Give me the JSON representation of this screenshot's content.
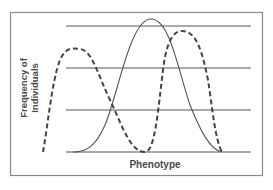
{
  "figure": {
    "x_axis_label": "Phenotype",
    "y_axis_label_line1": "Frequency of",
    "y_axis_label_line2": "Individuals"
  },
  "legend_semantics": {
    "solid_curve": "original distribution (bell-shaped)",
    "dashed_curve": "bimodal distribution (disruptive selection)"
  },
  "colors": {
    "line": "#555555",
    "border": "#777777",
    "text": "#4a4a4a",
    "background": "#ffffff"
  }
}
